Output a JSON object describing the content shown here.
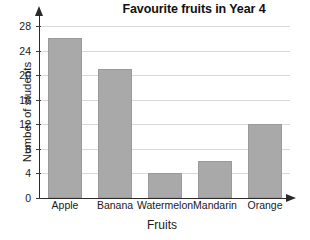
{
  "chart_data": {
    "type": "bar",
    "title": "Favourite fruits in Year 4",
    "xlabel": "Fruits",
    "ylabel": "Number of students",
    "categories": [
      "Apple",
      "Banana",
      "Watermelon",
      "Mandarin",
      "Orange"
    ],
    "values": [
      26,
      21,
      4,
      6,
      12
    ],
    "ylim": [
      0,
      28
    ],
    "yticks": [
      0,
      4,
      8,
      12,
      16,
      20,
      24,
      28
    ],
    "ytick_labels": [
      "0",
      "4",
      "8",
      "12",
      "16",
      "20",
      "24",
      "28"
    ],
    "grid": true,
    "legend": null,
    "legend_position": "none",
    "bar_color": "#a9a9a9",
    "axis_color": "#2b2b2b",
    "grid_color": "#d9d9d9",
    "background_color": "#ffffff"
  }
}
